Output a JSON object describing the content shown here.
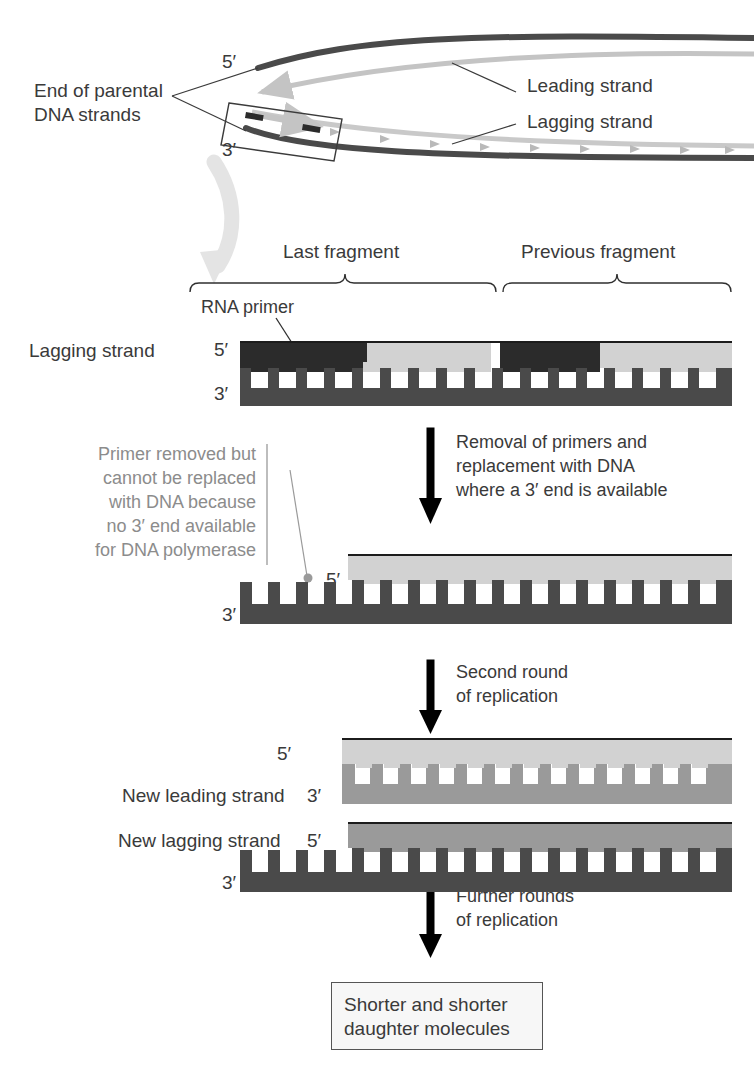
{
  "figure": {
    "type": "biology-diagram"
  },
  "colors": {
    "rna_primer": "#2b2b2b",
    "template_strand": "#4a4a4a",
    "new_dna": "#d2d2d2",
    "medium_gray": "#9a9a9a",
    "text_gray": "#7f7f7f",
    "text_dark": "#3a3a3a",
    "background": "#ffffff",
    "box_fill": "#f7f7f7"
  },
  "fork": {
    "label_parental": "End of parental\nDNA strands",
    "label_parental_line1": "End of parental",
    "label_parental_line2": "DNA strands",
    "label_leading": "Leading strand",
    "label_lagging": "Lagging strand",
    "end_5prime": "5′",
    "end_3prime": "3′"
  },
  "stage1": {
    "brace_last": "Last fragment",
    "brace_previous": "Previous fragment",
    "primer_label": "RNA primer",
    "strand_label": "Lagging strand",
    "end_5prime": "5′",
    "end_3prime": "3′",
    "rungs_total": 17,
    "fragments": [
      {
        "name": "Last fragment",
        "primer_rungs": 4,
        "dna_rungs": 6
      },
      {
        "name": "Previous fragment",
        "primer_rungs": 3,
        "dna_rungs": 4
      }
    ]
  },
  "arrow1": {
    "text": "Removal of primers and\nreplacement with DNA\nwhere a 3′ end is available",
    "line1": "Removal of primers and",
    "line2": "replacement with DNA",
    "line3": "where a 3′ end is available"
  },
  "annotation": {
    "text": "Primer removed but\ncannot be replaced\nwith DNA because\nno 3′ end available\nfor DNA polymerase",
    "line1": "Primer removed but",
    "line2": "cannot be replaced",
    "line3": "with DNA because",
    "line4": "no 3′ end available",
    "line5": "for DNA polymerase"
  },
  "stage2": {
    "end_5prime": "5′",
    "end_3prime": "3′",
    "gap_teeth": 4,
    "rungs": 16
  },
  "arrow2": {
    "text": "Second round\nof replication",
    "line1": "Second round",
    "line2": "of replication"
  },
  "stage3": {
    "leading_label": "New leading strand",
    "leading_5prime": "5′",
    "leading_3prime": "3′",
    "lagging_label": "New lagging strand",
    "lagging_5prime": "5′",
    "lagging_3prime": "3′",
    "leading_rungs": 14,
    "lagging_rungs": 13,
    "lagging_gap_teeth": 4
  },
  "arrow3": {
    "text": "Further rounds\nof replication",
    "line1": "Further rounds",
    "line2": "of replication"
  },
  "result": {
    "line1": "Shorter and shorter",
    "line2": "daughter molecules"
  }
}
